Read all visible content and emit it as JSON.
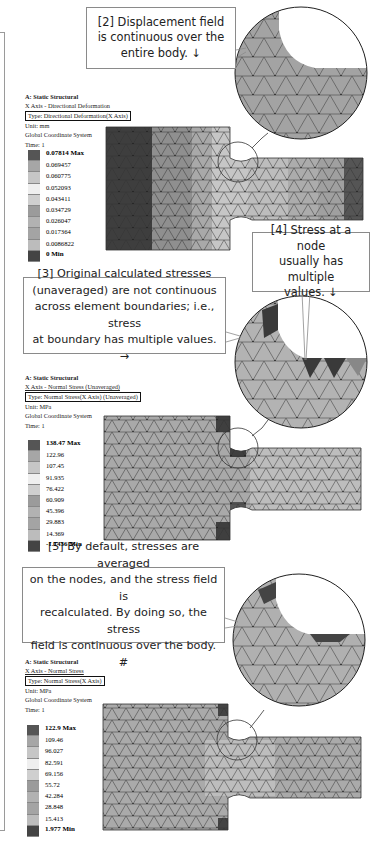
{
  "callouts": {
    "c2": {
      "lines": [
        "[2] Displacement field",
        "is continuous over the",
        "entire body. ↓"
      ]
    },
    "c4": {
      "lines": [
        "[4] Stress at a node",
        "usually has multiple",
        "values. ↓"
      ]
    },
    "c3": {
      "lines": [
        "[3] Original calculated stresses",
        "(unaveraged) are not continuous",
        "across element boundaries; i.e., stress",
        "at boundary has multiple values. →"
      ]
    },
    "c5": {
      "lines": [
        "[5] By default, stresses are averaged",
        "on the nodes, and the stress field is",
        "recalculated.  By doing so, the stress",
        "field is continuous over the body.  #"
      ]
    }
  },
  "panels": [
    {
      "header": {
        "analysis": "A: Static Structural",
        "result_name": "X Axis - Directional Deformation",
        "type": "Type: Directional Deformation(X Axis)",
        "unit": "Unit: mm",
        "coordinate_system": "Global Coordinate System",
        "time": "Time: 1"
      },
      "legend": [
        "0.07814 Max",
        "0.069457",
        "0.060775",
        "0.052093",
        "0.043411",
        "0.034729",
        "0.026047",
        "0.017364",
        "0.0086822",
        "0 Min"
      ]
    },
    {
      "header": {
        "analysis": "A: Static Structural",
        "result_name": "X Axis - Normal Stress (Unaveraged)",
        "type": "Type: Normal Stress(X Axis) (Unaveraged)",
        "unit": "Unit: MPa",
        "coordinate_system": "Global Coordinate System",
        "time": "Time: 1"
      },
      "legend": [
        "138.47 Max",
        "122.96",
        "107.45",
        "91.935",
        "76.422",
        "60.909",
        "45.396",
        "29.883",
        "14.369",
        "-1.1436 Min"
      ]
    },
    {
      "header": {
        "analysis": "A: Static Structural",
        "result_name": "X Axis - Normal Stress",
        "type": "Type: Normal Stress(X Axis)",
        "unit": "Unit: MPa",
        "coordinate_system": "Global Coordinate System",
        "time": "Time: 1"
      },
      "legend": [
        "122.9 Max",
        "109.46",
        "96.027",
        "82.591",
        "69.156",
        "55.72",
        "42.284",
        "28.848",
        "15.413",
        "1.977 Min"
      ]
    }
  ],
  "colors": {
    "scale": [
      "#555555",
      "#a8a8a8",
      "#c4c4c4",
      "#f0f0f0",
      "#d0d0d0",
      "#9c9c9c",
      "#b4b4b4",
      "#a6a6a6",
      "#bdbdbd",
      "#4a4a4a"
    ],
    "mesh_line": "#333333",
    "callout_border": "#8a8a8a"
  }
}
